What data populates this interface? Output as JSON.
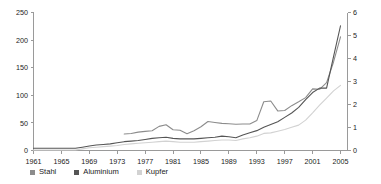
{
  "chart_data": {
    "type": "line",
    "title": "",
    "xlabel": "",
    "ylabel": "",
    "y2label": "",
    "grid": false,
    "legend_position": "bottom-left",
    "x": [
      1961,
      1962,
      1963,
      1964,
      1965,
      1966,
      1967,
      1968,
      1969,
      1970,
      1971,
      1972,
      1973,
      1974,
      1975,
      1976,
      1977,
      1978,
      1979,
      1980,
      1981,
      1982,
      1983,
      1984,
      1985,
      1986,
      1987,
      1988,
      1989,
      1990,
      1991,
      1992,
      1993,
      1994,
      1995,
      1996,
      1997,
      1998,
      1999,
      2000,
      2001,
      2002,
      2003,
      2004,
      2005
    ],
    "xlim": [
      1961,
      2006
    ],
    "xticks": [
      1961,
      1965,
      1969,
      1973,
      1977,
      1981,
      1985,
      1989,
      1993,
      1997,
      2001,
      2005
    ],
    "xticklabels": [
      "1961",
      "1965",
      "1969",
      "1973",
      "1977",
      "1981",
      "1985",
      "1989",
      "1993",
      "1997",
      "2001",
      "2005"
    ],
    "ylim": [
      0,
      250
    ],
    "yticks": [
      0,
      50,
      100,
      150,
      200,
      250
    ],
    "yticklabels": [
      "0",
      "50",
      "100",
      "150",
      "200",
      "250"
    ],
    "y2lim": [
      0,
      6
    ],
    "y2ticks": [
      0,
      1,
      2,
      3,
      4,
      5,
      6
    ],
    "y2ticklabels": [
      "0",
      "1",
      "2",
      "3",
      "4",
      "5",
      "6"
    ],
    "series": [
      {
        "name": "Stahl",
        "axis": "right",
        "color": "#8c8c8c",
        "x": [
          1974,
          1975,
          1976,
          1977,
          1978,
          1979,
          1980,
          1981,
          1982,
          1983,
          1984,
          1985,
          1986,
          1987,
          1988,
          1989,
          1990,
          1991,
          1992,
          1993,
          1994,
          1995,
          1996,
          1997,
          1998,
          1999,
          2000,
          2001,
          2002,
          2003,
          2004,
          2005
        ],
        "values": [
          0.72,
          0.74,
          0.8,
          0.83,
          0.86,
          1.05,
          1.12,
          0.9,
          0.88,
          0.73,
          0.86,
          1.03,
          1.26,
          1.22,
          1.18,
          1.16,
          1.14,
          1.15,
          1.15,
          1.3,
          2.12,
          2.15,
          1.72,
          1.74,
          1.95,
          2.12,
          2.3,
          2.68,
          2.66,
          2.95,
          3.85,
          4.94
        ]
      },
      {
        "name": "Aluminium",
        "axis": "left",
        "color": "#555555",
        "x": [
          1961,
          1962,
          1963,
          1964,
          1965,
          1966,
          1967,
          1968,
          1969,
          1970,
          1971,
          1972,
          1973,
          1974,
          1975,
          1976,
          1977,
          1978,
          1979,
          1980,
          1981,
          1982,
          1983,
          1984,
          1985,
          1986,
          1987,
          1988,
          1989,
          1990,
          1991,
          1992,
          1993,
          1994,
          1995,
          1996,
          1997,
          1998,
          1999,
          2000,
          2001,
          2002,
          2003,
          2004,
          2005
        ],
        "values": [
          4,
          4,
          4,
          4,
          4,
          4,
          4,
          6,
          8,
          10,
          11,
          12,
          14,
          16,
          17,
          18,
          20,
          22,
          23,
          24,
          22,
          21,
          21,
          21,
          22,
          23,
          24,
          26,
          25,
          23,
          28,
          32,
          36,
          42,
          47,
          52,
          60,
          68,
          78,
          92,
          105,
          113,
          113,
          170,
          226
        ]
      },
      {
        "name": "Kupfer",
        "axis": "left",
        "color": "#d2d2d2",
        "x": [
          1961,
          1962,
          1963,
          1964,
          1965,
          1966,
          1967,
          1968,
          1969,
          1970,
          1971,
          1972,
          1973,
          1974,
          1975,
          1976,
          1977,
          1978,
          1979,
          1980,
          1981,
          1982,
          1983,
          1984,
          1985,
          1986,
          1987,
          1988,
          1989,
          1990,
          1991,
          1992,
          1993,
          1994,
          1995,
          1996,
          1997,
          1998,
          1999,
          2000,
          2001,
          2002,
          2003,
          2004,
          2005
        ],
        "values": [
          1,
          1,
          1,
          1,
          1,
          1,
          1,
          3,
          5,
          6,
          7,
          8,
          9,
          11,
          12,
          13,
          14,
          15,
          16,
          17,
          16,
          15,
          15,
          15,
          16,
          17,
          18,
          19,
          19,
          18,
          21,
          23,
          26,
          31,
          32,
          35,
          38,
          42,
          46,
          55,
          68,
          82,
          95,
          108,
          118
        ]
      }
    ],
    "annotations": []
  },
  "legend": {
    "items": [
      {
        "label": "Stahl",
        "color": "#8c8c8c"
      },
      {
        "label": "Aluminium",
        "color": "#555555"
      },
      {
        "label": "Kupfer",
        "color": "#d2d2d2"
      }
    ]
  },
  "colors": {
    "axis": "#9a9a9a",
    "text": "#222222",
    "background": "#ffffff"
  }
}
